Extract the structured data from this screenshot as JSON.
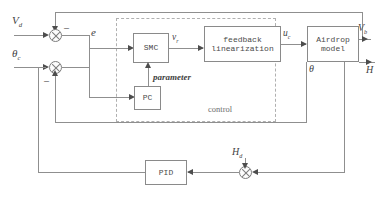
{
  "diagram": {
    "blocks": {
      "smc": "SMC",
      "feedback_linearization_line1": "feedback",
      "feedback_linearization_line2": "linearization",
      "airdrop_model_line1": "Airdrop",
      "airdrop_model_line2": "model",
      "pc": "PC",
      "pid": "PID"
    },
    "group_label": "control",
    "signals": {
      "v_desired": "V",
      "v_desired_sub": "d",
      "theta_command": "θ",
      "theta_command_sub": "c",
      "error": "e",
      "v_r": "v",
      "v_r_sub": "r",
      "u_c": "u",
      "u_c_sub": "c",
      "parameter": "parameter",
      "v_out": "V",
      "v_out_sub": "b",
      "theta_out": "θ",
      "altitude": "H",
      "h_desired": "H",
      "h_desired_sub": "d"
    },
    "signs": {
      "velocity_feedback_minus": "–",
      "theta_feedback_minus": "–",
      "altitude_feedback_minus": "–"
    },
    "colors": {
      "line": "#8f8f8f",
      "block_border": "#8a8a8a",
      "dashed_border": "#b0b0b0",
      "text": "#4a4a4a",
      "background": "#ffffff"
    }
  }
}
